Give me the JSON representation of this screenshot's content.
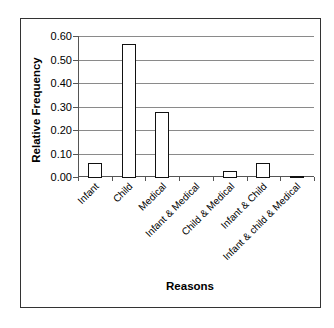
{
  "chart_data": {
    "type": "bar",
    "title": "",
    "xlabel": "Reasons",
    "ylabel": "Relative Frequency",
    "ylim": [
      0,
      0.6
    ],
    "yticks": [
      "0.00",
      "0.10",
      "0.20",
      "0.30",
      "0.40",
      "0.50",
      "0.60"
    ],
    "grid": true,
    "legend": null,
    "categories": [
      "Infant",
      "Child",
      "Medical",
      "Infant & Medical",
      "Child & Medical",
      "Infant & Child",
      "Infant & child & Medical"
    ],
    "values": [
      0.06,
      0.565,
      0.275,
      0.0,
      0.025,
      0.06,
      0.003
    ]
  }
}
